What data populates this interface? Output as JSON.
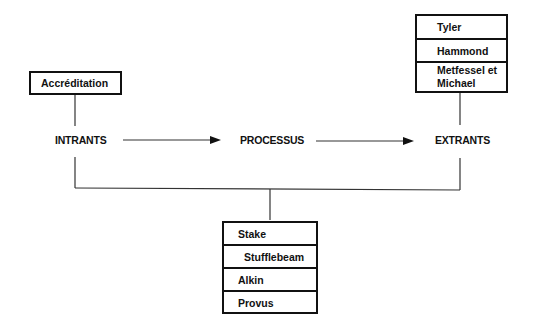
{
  "diagram": {
    "stages": [
      {
        "label": "INTRANTS"
      },
      {
        "label": "PROCESSUS"
      },
      {
        "label": "EXTRANTS"
      }
    ],
    "inputs_box": {
      "items": [
        "Accréditation"
      ]
    },
    "outputs_box": {
      "items": [
        "Tyler",
        "Hammond",
        "Metfessel et Michael"
      ]
    },
    "bottom_box": {
      "items": [
        "Stake",
        "Stufflebeam",
        "Alkin",
        "Provus"
      ]
    }
  }
}
